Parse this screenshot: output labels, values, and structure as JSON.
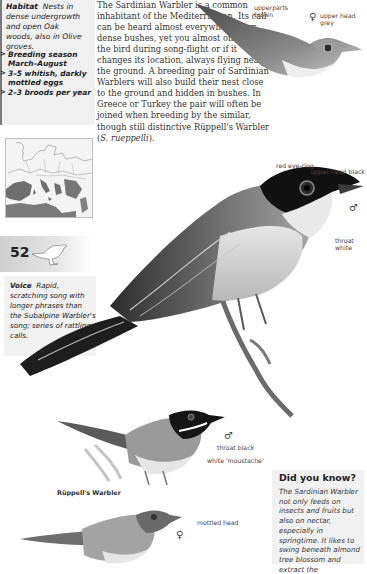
{
  "sidebar": {
    "habitat": {
      "label": "Habitat",
      "text": "Nests in dense undergrowth and open Oak woods, also in Olive groves."
    },
    "facts": [
      {
        "marker": ">",
        "text": "Breeding season March–August"
      },
      {
        "marker": ">",
        "text": "3–5 whitish, darkly mottled eggs"
      },
      {
        "marker": ">",
        "text": "2–3 broods per year"
      }
    ],
    "map_label": "distribution-map",
    "page_number": "52",
    "voice": {
      "label": "Voice",
      "text": "Rapid, scratching song with longer phrases than the Subalpine Warbler's song; series of rattling calls."
    }
  },
  "main": {
    "body_text_pre": "The Sardinian Warbler is a common inhabitant of the Mediterranean. Its call can be heard almost everywhere from dense bushes, yet you almost only spot the bird during song-flight or if it changes its location, always flying near the ground. A breeding pair of Sardinian Warblers will also build their nest close to the ground and hidden in bushes. In Greece or Turkey the pair will often be joined when breeding by the similar, though still distinctive Rüppell's Warbler (",
    "body_text_italic": "S. rueppelli",
    "body_text_post": ")."
  },
  "illustrations": {
    "female_top": {
      "label_upperparts": "upperparts brown",
      "sex_symbol": "♀",
      "label_head": "upper head grey"
    },
    "male_main": {
      "label_eye": "red eye-ring",
      "label_head": "upper head black",
      "sex_symbol": "♂",
      "label_throat": "throat white"
    },
    "ruppell_male": {
      "sex_symbol": "♂",
      "label_throat": "throat black",
      "label_moustache": "white 'moustache'"
    },
    "ruppell_caption": "Rüppell's Warbler",
    "ruppell_female": {
      "label_head": "mottled head",
      "sex_symbol": "♀"
    }
  },
  "did_you_know": {
    "title": "Did you know?",
    "text": "The Sardinian Warbler not only feeds on insects and fruits but also on nectar, especially in springtime. It likes to swing beneath almond tree blossom and extract the"
  },
  "colors": {
    "sidebar_bg": "#f0f0f0",
    "rule": "#7a7a7a",
    "text": "#222222",
    "map_range": "#6e6e6e"
  }
}
